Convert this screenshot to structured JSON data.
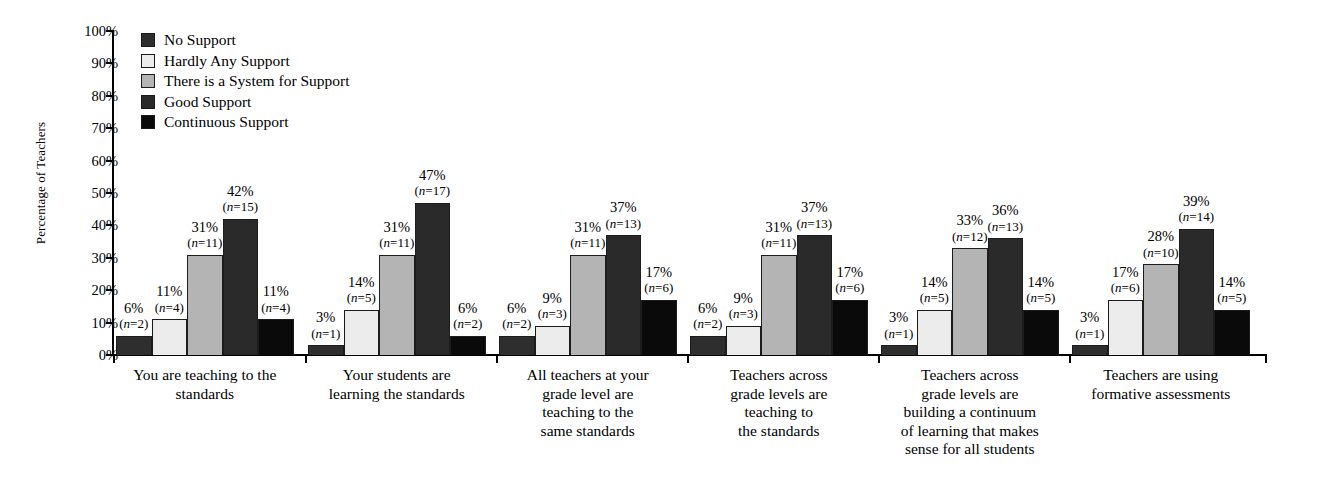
{
  "chart_data": {
    "type": "bar",
    "title": "",
    "xlabel": "",
    "ylabel": "Percentage of Teachers",
    "ylim": [
      0,
      100
    ],
    "yticks": [
      "0%",
      "10%",
      "20%",
      "30%",
      "40%",
      "50%",
      "60%",
      "70%",
      "80%",
      "90%",
      "100%"
    ],
    "grid": false,
    "legend_position": "top-left",
    "categories": [
      "You are teaching to the\nstandards",
      "Your students are\nlearning the standards",
      "All teachers at your\ngrade level are\nteaching to the\nsame standards",
      "Teachers across\ngrade levels are\nteaching to\nthe standards",
      "Teachers across\ngrade levels are\nbuilding a continuum\nof learning that makes\nsense for all students",
      "Teachers are using\nformative assessments"
    ],
    "series": [
      {
        "name": "No Support",
        "color": "#2e2e2e",
        "values": [
          6,
          3,
          6,
          6,
          3,
          3
        ],
        "counts": [
          2,
          1,
          2,
          2,
          1,
          1
        ],
        "labels": [
          "6%",
          "3%",
          "6%",
          "6%",
          "3%",
          "3%"
        ],
        "count_labels": [
          "(n=2)",
          "(n=1)",
          "(n=2)",
          "(n=2)",
          "(n=1)",
          "(n=1)"
        ]
      },
      {
        "name": "Hardly Any Support",
        "color": "#ececec",
        "values": [
          11,
          14,
          9,
          9,
          14,
          17
        ],
        "counts": [
          4,
          5,
          3,
          3,
          5,
          6
        ],
        "labels": [
          "11%",
          "14%",
          "9%",
          "9%",
          "14%",
          "17%"
        ],
        "count_labels": [
          "(n=4)",
          "(n=5)",
          "(n=3)",
          "(n=3)",
          "(n=5)",
          "(n=6)"
        ]
      },
      {
        "name": "There is a System for Support",
        "color": "#b4b4b4",
        "values": [
          31,
          31,
          31,
          31,
          33,
          28
        ],
        "counts": [
          11,
          11,
          11,
          11,
          12,
          10
        ],
        "labels": [
          "31%",
          "31%",
          "31%",
          "31%",
          "33%",
          "28%"
        ],
        "count_labels": [
          "(n=11)",
          "(n=11)",
          "(n=11)",
          "(n=11)",
          "(n=12)",
          "(n=10)"
        ]
      },
      {
        "name": "Good Support",
        "color": "#2a2a2a",
        "values": [
          42,
          47,
          37,
          37,
          36,
          39
        ],
        "counts": [
          15,
          17,
          13,
          13,
          13,
          14
        ],
        "labels": [
          "42%",
          "47%",
          "37%",
          "37%",
          "36%",
          "39%"
        ],
        "count_labels": [
          "(n=15)",
          "(n=17)",
          "(n=13)",
          "(n=13)",
          "(n=13)",
          "(n=14)"
        ]
      },
      {
        "name": "Continuous Support",
        "color": "#0a0a0a",
        "values": [
          11,
          6,
          17,
          17,
          14,
          14
        ],
        "counts": [
          4,
          2,
          6,
          6,
          5,
          5
        ],
        "labels": [
          "11%",
          "6%",
          "17%",
          "17%",
          "14%",
          "14%"
        ],
        "count_labels": [
          "(n=4)",
          "(n=2)",
          "(n=6)",
          "(n=6)",
          "(n=5)",
          "(n=5)"
        ]
      }
    ]
  },
  "legend": {
    "items": [
      {
        "label": "No Support",
        "color": "#2e2e2e"
      },
      {
        "label": "Hardly Any Support",
        "color": "#ececec"
      },
      {
        "label": "There is a System for Support",
        "color": "#b4b4b4"
      },
      {
        "label": "Good Support",
        "color": "#2a2a2a"
      },
      {
        "label": "Continuous Support",
        "color": "#0a0a0a"
      }
    ]
  },
  "axes": {
    "y_title": "Percentage of Teachers",
    "y_ticks": [
      "100%",
      "90%",
      "80%",
      "70%",
      "60%",
      "50%",
      "40%",
      "30%",
      "20%",
      "10%",
      "0%"
    ]
  }
}
